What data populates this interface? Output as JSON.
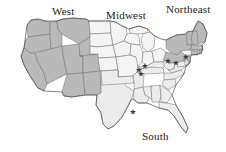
{
  "map": {
    "title": "United States Census Regions Map",
    "projection_note": "contiguous-united-states",
    "colors": {
      "shaded_region_fill": "#b9b9b9",
      "light_region_fill": "#ececec",
      "unshaded_fill": "#f4f4f4",
      "state_border": "#6e6e6e",
      "outline": "#4a4a4a",
      "label_text": "#1a1a1a",
      "marker": "#3a3a3a",
      "background": "#ffffff"
    },
    "labels": [
      {
        "id": "west",
        "text": "West",
        "x": 52,
        "y": 6
      },
      {
        "id": "midwest",
        "text": "Midwest",
        "x": 106,
        "y": 10
      },
      {
        "id": "northeast",
        "text": "Northeast",
        "x": 166,
        "y": 4
      },
      {
        "id": "south",
        "text": "South",
        "x": 142,
        "y": 131
      }
    ],
    "regions": [
      {
        "id": "west",
        "name": "West",
        "shading": "dark",
        "fill": "#b9b9b9"
      },
      {
        "id": "midwest",
        "name": "Midwest",
        "shading": "light",
        "fill": "#f4f4f4"
      },
      {
        "id": "northeast",
        "name": "Northeast",
        "shading": "dark",
        "fill": "#b9b9b9"
      },
      {
        "id": "south",
        "name": "South",
        "shading": "light",
        "fill": "#ececec"
      }
    ],
    "markers": [
      {
        "id": "marker-1",
        "x": 139,
        "y": 70
      },
      {
        "id": "marker-2",
        "x": 145,
        "y": 66
      },
      {
        "id": "marker-3",
        "x": 168,
        "y": 61
      },
      {
        "id": "marker-4",
        "x": 176,
        "y": 63
      },
      {
        "id": "marker-5",
        "x": 186,
        "y": 57
      },
      {
        "id": "marker-6",
        "x": 133,
        "y": 112
      },
      {
        "id": "marker-7",
        "x": 141,
        "y": 74
      }
    ]
  }
}
